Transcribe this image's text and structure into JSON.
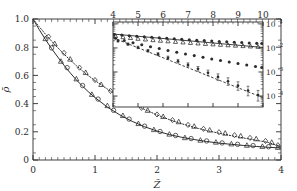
{
  "figure": {
    "background": "#ffffff",
    "ink": "#2b2b2b"
  },
  "chart_data": {
    "type": "line",
    "title": "",
    "xlabel": "Z̃",
    "ylabel": "ρ̄",
    "xlim": [
      0,
      4
    ],
    "ylim": [
      0,
      1.0
    ],
    "xticks": [
      0,
      1,
      2,
      3,
      4
    ],
    "xticklabels": [
      "0",
      "1",
      "2",
      "3",
      "4"
    ],
    "yticks": [
      0,
      0.2,
      0.4,
      0.6,
      0.8,
      1.0
    ],
    "yticklabels": [
      "0",
      "0.2",
      "0.4",
      "0.6",
      "0.8",
      "1.0"
    ],
    "grid": false,
    "legend": "none",
    "minor_ticks": true,
    "series": [
      {
        "name": "lower-solid-curve",
        "style": "solid",
        "marker": "none",
        "x": [
          0,
          0.1,
          0.2,
          0.3,
          0.4,
          0.5,
          0.6,
          0.7,
          0.8,
          0.9,
          1.0,
          1.2,
          1.4,
          1.6,
          1.8,
          2.0,
          2.2,
          2.4,
          2.6,
          2.8,
          3.0,
          3.2,
          3.4,
          3.6,
          3.8,
          4.0
        ],
        "y": [
          1.0,
          0.925,
          0.855,
          0.79,
          0.73,
          0.672,
          0.618,
          0.568,
          0.523,
          0.481,
          0.443,
          0.375,
          0.32,
          0.274,
          0.236,
          0.205,
          0.18,
          0.161,
          0.145,
          0.131,
          0.12,
          0.111,
          0.103,
          0.096,
          0.09,
          0.085
        ]
      },
      {
        "name": "lower-triangle-markers",
        "style": "markers",
        "marker": "triangle-up",
        "x": [
          0.2,
          0.45,
          0.7,
          0.95,
          1.2,
          1.45,
          1.7,
          1.95,
          2.2,
          2.45,
          2.7,
          2.95,
          3.2,
          3.45,
          3.7,
          3.95
        ],
        "y": [
          0.86,
          0.7,
          0.575,
          0.465,
          0.385,
          0.315,
          0.258,
          0.215,
          0.183,
          0.158,
          0.14,
          0.126,
          0.114,
          0.104,
          0.096,
          0.089
        ]
      },
      {
        "name": "lower-circle-markers",
        "style": "markers",
        "marker": "circle",
        "x": [
          0.3,
          0.55,
          0.8,
          1.05,
          1.3,
          1.55,
          1.8,
          2.05,
          2.3,
          2.55,
          2.8,
          3.05,
          3.3,
          3.55,
          3.8
        ],
        "y": [
          0.795,
          0.655,
          0.528,
          0.432,
          0.352,
          0.29,
          0.24,
          0.202,
          0.174,
          0.152,
          0.135,
          0.121,
          0.111,
          0.102,
          0.094
        ]
      },
      {
        "name": "upper-dotted-curve",
        "style": "dotted",
        "marker": "none",
        "x": [
          0,
          0.1,
          0.2,
          0.3,
          0.4,
          0.5,
          0.6,
          0.7,
          0.8,
          0.9,
          1.0,
          1.2,
          1.4,
          1.6,
          1.8,
          2.0,
          2.2,
          2.4,
          2.6,
          2.8,
          3.0,
          3.2,
          3.4,
          3.6,
          3.8,
          4.0
        ],
        "y": [
          1.0,
          0.945,
          0.893,
          0.843,
          0.796,
          0.751,
          0.709,
          0.669,
          0.631,
          0.596,
          0.563,
          0.503,
          0.449,
          0.401,
          0.358,
          0.32,
          0.286,
          0.257,
          0.231,
          0.209,
          0.19,
          0.172,
          0.156,
          0.14,
          0.124,
          0.095
        ]
      },
      {
        "name": "upper-diamond-markers",
        "style": "markers",
        "marker": "diamond",
        "x": [
          0.25,
          0.5,
          0.75,
          1.0,
          1.25,
          1.5,
          1.75,
          2.0,
          2.25,
          2.5,
          2.75,
          3.0,
          3.25,
          3.5,
          3.75,
          3.95
        ],
        "y": [
          0.875,
          0.76,
          0.655,
          0.567,
          0.49,
          0.425,
          0.37,
          0.323,
          0.283,
          0.249,
          0.221,
          0.197,
          0.176,
          0.157,
          0.135,
          0.105
        ]
      },
      {
        "name": "upper-triangle-markers",
        "style": "markers",
        "marker": "triangle-up",
        "x": [
          0.35,
          0.6,
          0.85,
          1.1,
          1.35,
          1.6,
          1.85,
          2.1,
          2.35,
          2.6,
          2.85,
          3.1,
          3.35,
          3.6,
          3.85
        ],
        "y": [
          0.825,
          0.715,
          0.62,
          0.535,
          0.465,
          0.404,
          0.352,
          0.308,
          0.271,
          0.239,
          0.212,
          0.19,
          0.17,
          0.15,
          0.125
        ]
      }
    ]
  },
  "inset_chart_data": {
    "type": "scatter",
    "yscale": "log",
    "xlim": [
      4,
      10
    ],
    "ylim": [
      3.5e-05,
      0.12
    ],
    "xticks": [
      4,
      5,
      6,
      7,
      8,
      9,
      10
    ],
    "xticklabels": [
      "4",
      "5",
      "6",
      "7",
      "8",
      "9",
      "10"
    ],
    "xaxis_position": "top",
    "yaxis_position": "right",
    "yticks": [
      0.1,
      0.01,
      0.001,
      0.0001
    ],
    "yticklabels": [
      "10",
      "10",
      "10",
      "10"
    ],
    "yticklabel_exponents": [
      "-1",
      "-2",
      "-3",
      "-4"
    ],
    "grid": false,
    "legend": "none",
    "series": [
      {
        "name": "inset-solid-line-top",
        "style": "solid",
        "marker": "none",
        "x": [
          4.0,
          10.0
        ],
        "y": [
          0.038,
          0.0105
        ]
      },
      {
        "name": "inset-open-triangles",
        "style": "markers",
        "marker": "triangle-up",
        "x": [
          4.1,
          4.4,
          4.7,
          5.0,
          5.3,
          5.6,
          5.9,
          6.2,
          6.5,
          6.8,
          7.1,
          7.4,
          7.7,
          8.0,
          8.3,
          8.6,
          8.9,
          9.2,
          9.5,
          9.8
        ],
        "y": [
          0.0315,
          0.0285,
          0.0262,
          0.0243,
          0.0228,
          0.0214,
          0.0202,
          0.0191,
          0.0181,
          0.0172,
          0.0164,
          0.0156,
          0.0149,
          0.0143,
          0.0137,
          0.0131,
          0.0126,
          0.0121,
          0.0117,
          0.0113
        ]
      },
      {
        "name": "inset-filled-dots-top",
        "style": "markers",
        "marker": "filled-circle",
        "x": [
          4.05,
          4.35,
          4.65,
          4.95,
          5.25,
          5.55,
          5.85,
          6.15,
          6.45,
          6.75,
          7.05,
          7.35,
          7.65,
          7.95,
          8.25,
          8.55,
          8.85,
          9.15,
          9.45,
          9.75,
          9.95
        ],
        "y": [
          0.0365,
          0.0342,
          0.0322,
          0.0305,
          0.029,
          0.0276,
          0.0263,
          0.0251,
          0.024,
          0.023,
          0.022,
          0.0211,
          0.0203,
          0.0195,
          0.0187,
          0.018,
          0.0173,
          0.0167,
          0.0161,
          0.0155,
          0.0152
        ]
      },
      {
        "name": "inset-filled-dots-middle",
        "style": "markers",
        "marker": "filled-circle",
        "x": [
          4.1,
          4.45,
          4.8,
          5.15,
          5.5,
          5.85,
          6.2,
          6.55,
          6.9,
          7.25,
          7.6,
          7.95,
          8.3,
          8.65,
          9.0,
          9.35,
          9.7,
          9.95
        ],
        "y": [
          0.0255,
          0.0205,
          0.0166,
          0.0136,
          0.0112,
          0.0094,
          0.0079,
          0.0066,
          0.0056,
          0.0048,
          0.0041,
          0.0035,
          0.003,
          0.0026,
          0.00225,
          0.00195,
          0.0017,
          0.00155
        ]
      },
      {
        "name": "inset-dashed-line-bottom",
        "style": "dashed",
        "marker": "none",
        "x": [
          4.0,
          10.0
        ],
        "y": [
          0.0265,
          8.5e-05
        ]
      },
      {
        "name": "inset-errorbar-points",
        "style": "markers-errorbars",
        "marker": "cross",
        "x": [
          4.2,
          4.6,
          5.0,
          5.4,
          5.8,
          6.2,
          6.6,
          7.0,
          7.4,
          7.8,
          8.2,
          8.6,
          9.0,
          9.4,
          9.8
        ],
        "y": [
          0.0195,
          0.0143,
          0.0104,
          0.0076,
          0.0055,
          0.0039,
          0.0028,
          0.00196,
          0.00135,
          0.00092,
          0.00062,
          0.00041,
          0.00027,
          0.00017,
          0.00011
        ],
        "yerr_rel": [
          0.12,
          0.12,
          0.13,
          0.14,
          0.15,
          0.17,
          0.19,
          0.22,
          0.25,
          0.3,
          0.35,
          0.4,
          0.45,
          0.5,
          0.55
        ]
      }
    ]
  }
}
